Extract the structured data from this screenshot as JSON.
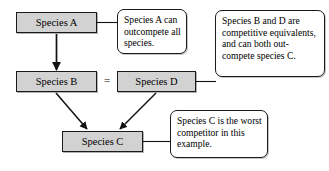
{
  "diagram": {
    "background_color": "#ffffff",
    "node_fill_color": "#d2d2d2",
    "node_border_color": "#1a1a1a",
    "callout_fill_color": "#ffffff",
    "nodes": [
      {
        "id": "species_a",
        "label": "Species A"
      },
      {
        "id": "species_b",
        "label": "Species B"
      },
      {
        "id": "species_d",
        "label": "Species D"
      },
      {
        "id": "species_c",
        "label": "Species C"
      }
    ],
    "operators": [
      {
        "id": "equals_b_d",
        "symbol": "=",
        "between": [
          "species_b",
          "species_d"
        ]
      }
    ],
    "arrows": [
      {
        "from": "species_a",
        "to": "species_b",
        "style": "solid-arrow"
      },
      {
        "from": "species_b",
        "to": "species_c",
        "style": "solid-arrow"
      },
      {
        "from": "species_d",
        "to": "species_c",
        "style": "solid-arrow"
      }
    ],
    "connectors": [
      {
        "from": "species_a",
        "to": "callout_a",
        "style": "plain-line"
      },
      {
        "from": "species_d",
        "to": "callout_bd",
        "style": "plain-line"
      },
      {
        "from": "species_c",
        "to": "callout_c",
        "style": "plain-line"
      }
    ],
    "callouts": [
      {
        "id": "callout_a",
        "text": "Species A can outcompete all species."
      },
      {
        "id": "callout_bd",
        "text": "Species B and D are competitive equivalents, and can both out-compete species C."
      },
      {
        "id": "callout_c",
        "text": "Species C is the worst competitor in this example."
      }
    ]
  }
}
